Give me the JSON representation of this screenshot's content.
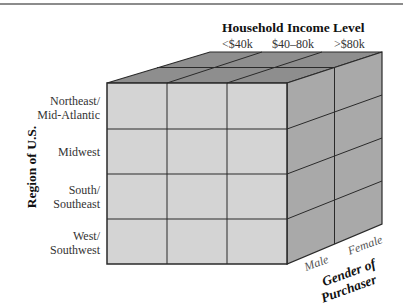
{
  "diagram": {
    "type": "data-cube",
    "top_axis": {
      "title": "Household Income Level",
      "categories": [
        "<$40k",
        "$40–80k",
        ">$80k"
      ]
    },
    "left_axis": {
      "title": "Region of U.S.",
      "categories": [
        "Northeast/\nMid-Atlantic",
        "Midwest",
        "South/\nSoutheast",
        "West/\nSouthwest"
      ],
      "lines": [
        [
          "Northeast/",
          "Mid-Atlantic"
        ],
        [
          "Midwest"
        ],
        [
          "South/",
          "Southeast"
        ],
        [
          "West/",
          "Southwest"
        ]
      ]
    },
    "depth_axis": {
      "title_line1": "Gender of",
      "title_line2": "Purchaser",
      "categories": [
        "Male",
        "Female"
      ]
    },
    "colors": {
      "front": "#d4d4d4",
      "top": "#8e8e8e",
      "side": "#a9a9a9",
      "edge": "#2a2a2a"
    }
  }
}
